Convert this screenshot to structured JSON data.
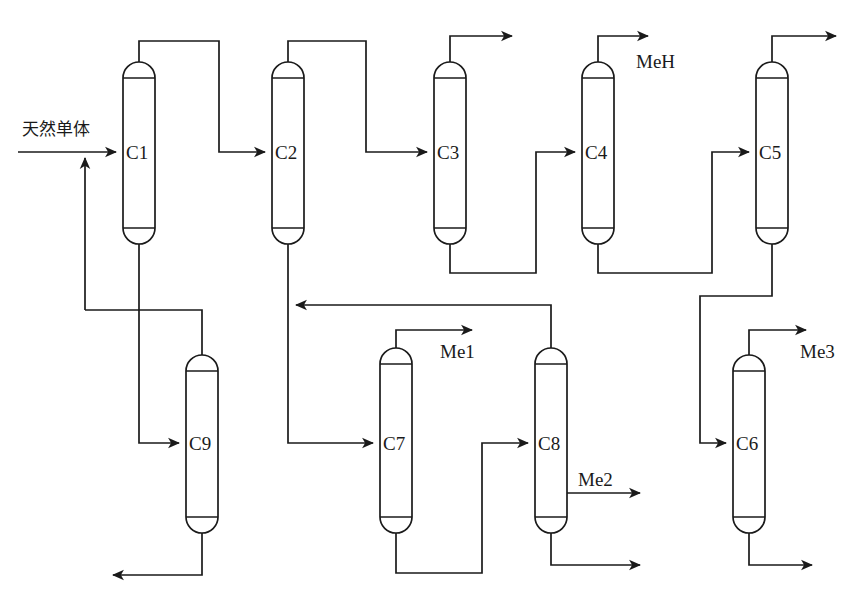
{
  "diagram": {
    "kind": "process-flow-diagram",
    "title_visible": false,
    "line_color": "#1a1a1a",
    "background_color": "#ffffff",
    "columns": [
      {
        "id": "C1",
        "label": "C1",
        "x": 139,
        "top": 62,
        "bottom": 243,
        "width": 32
      },
      {
        "id": "C2",
        "label": "C2",
        "x": 288,
        "top": 62,
        "bottom": 243,
        "width": 32
      },
      {
        "id": "C3",
        "label": "C3",
        "x": 450,
        "top": 62,
        "bottom": 243,
        "width": 32
      },
      {
        "id": "C4",
        "label": "C4",
        "x": 598,
        "top": 62,
        "bottom": 243,
        "width": 32
      },
      {
        "id": "C5",
        "label": "C5",
        "x": 772,
        "top": 62,
        "bottom": 243,
        "width": 32
      },
      {
        "id": "C9",
        "label": "C9",
        "x": 202,
        "top": 355,
        "bottom": 533,
        "width": 32
      },
      {
        "id": "C7",
        "label": "C7",
        "x": 396,
        "top": 348,
        "bottom": 533,
        "width": 32
      },
      {
        "id": "C8",
        "label": "C8",
        "x": 551,
        "top": 348,
        "bottom": 533,
        "width": 32
      },
      {
        "id": "C6",
        "label": "C6",
        "x": 749,
        "top": 355,
        "bottom": 533,
        "width": 32
      }
    ],
    "stream_labels": [
      {
        "id": "feed",
        "text": "天然单体",
        "x": 22,
        "y": 135,
        "script": "cjk"
      },
      {
        "id": "meh",
        "text": "MeH",
        "x": 636,
        "y": 68,
        "script": "latin"
      },
      {
        "id": "me1",
        "text": "Me1",
        "x": 440,
        "y": 358,
        "script": "latin"
      },
      {
        "id": "me2",
        "text": "Me2",
        "x": 578,
        "y": 486,
        "script": "latin"
      },
      {
        "id": "me3",
        "text": "Me3",
        "x": 800,
        "y": 358,
        "script": "latin"
      }
    ],
    "streams": [
      {
        "id": "feed-inlet",
        "from": "feed",
        "to": "C1",
        "description": "natural monomer feed entering C1"
      },
      {
        "id": "recycle-to-feed",
        "from": "C9-area",
        "to": "feed-inlet",
        "description": "recycle riser joining the feed line"
      },
      {
        "id": "C1-overhead",
        "from": "C1",
        "to": "C2",
        "description": "C1 overhead routed to C2 feed"
      },
      {
        "id": "C1-bottoms",
        "from": "C1",
        "to": "C9",
        "description": "C1 bottoms routed down to C9 feed"
      },
      {
        "id": "C2-overhead",
        "from": "C2",
        "to": "C3",
        "description": "C2 overhead routed to C3 feed"
      },
      {
        "id": "C2-bottoms",
        "from": "C2",
        "to": "C7",
        "description": "C2 bottoms routed down to C7 feed"
      },
      {
        "id": "C3-overhead",
        "from": "C3",
        "to": "product",
        "description": "C3 overhead product to arrow"
      },
      {
        "id": "C3-bottoms",
        "from": "C3",
        "to": "C4",
        "description": "C3 bottoms routed to C4 feed"
      },
      {
        "id": "C4-overhead",
        "from": "C4",
        "to": "MeH",
        "description": "C4 overhead MeH product"
      },
      {
        "id": "C4-bottoms",
        "from": "C4",
        "to": "C5",
        "description": "C4 bottoms routed to C5 feed"
      },
      {
        "id": "C5-overhead",
        "from": "C5",
        "to": "product",
        "description": "C5 overhead product to arrow"
      },
      {
        "id": "C5-bottoms",
        "from": "C5",
        "to": "C6",
        "description": "C5 bottoms routed down to C6 feed"
      },
      {
        "id": "C6-overhead",
        "from": "C6",
        "to": "Me3",
        "description": "C6 overhead Me3 product"
      },
      {
        "id": "C6-bottoms",
        "from": "C6",
        "to": "product",
        "description": "C6 bottoms to arrow"
      },
      {
        "id": "C7-overhead",
        "from": "C7",
        "to": "Me1",
        "description": "C7 overhead Me1 product"
      },
      {
        "id": "C7-bottoms",
        "from": "C7",
        "to": "C8",
        "description": "C7 bottoms routed to C8 feed"
      },
      {
        "id": "C8-overhead",
        "from": "C8",
        "to": "C7",
        "description": "C8 overhead recycled left to C7 feed"
      },
      {
        "id": "C8-sidedraw",
        "from": "C8",
        "to": "Me2",
        "description": "C8 side draw Me2 product"
      },
      {
        "id": "C8-bottoms",
        "from": "C8",
        "to": "product",
        "description": "C8 bottoms to arrow"
      },
      {
        "id": "C9-bottoms",
        "from": "C9",
        "to": "product",
        "description": "C9 bottoms to left-pointing arrow"
      }
    ]
  }
}
